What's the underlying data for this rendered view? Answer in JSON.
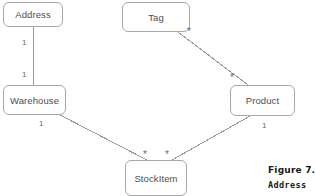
{
  "diagram": {
    "type": "uml-class-diagram",
    "background_color": "#ffffff",
    "node_border_color": "#a8a8a8",
    "node_text_color": "#4d4d4d",
    "edge_color": "#9a9a9a",
    "multiplicity_color": "#6a6a6a",
    "nodes": [
      {
        "id": "address",
        "label": "Address",
        "x": 3,
        "y": 2,
        "w": 60,
        "h": 25
      },
      {
        "id": "tag",
        "label": "Tag",
        "x": 122,
        "y": 2,
        "w": 68,
        "h": 30
      },
      {
        "id": "warehouse",
        "label": "Warehouse",
        "x": 3,
        "y": 85,
        "w": 63,
        "h": 30
      },
      {
        "id": "product",
        "label": "Product",
        "x": 230,
        "y": 85,
        "w": 65,
        "h": 31
      },
      {
        "id": "stockitem",
        "label": "StockItem",
        "x": 125,
        "y": 160,
        "w": 62,
        "h": 36
      }
    ],
    "edges": [
      {
        "id": "address-warehouse",
        "from": "address",
        "to": "warehouse",
        "x1": 33,
        "y1": 27,
        "x2": 33,
        "y2": 85
      },
      {
        "id": "tag-product",
        "from": "tag",
        "to": "product",
        "x1": 178,
        "y1": 32,
        "x2": 248,
        "y2": 85
      },
      {
        "id": "warehouse-stockitem",
        "from": "warehouse",
        "to": "stockitem",
        "x1": 60,
        "y1": 115,
        "x2": 147,
        "y2": 160
      },
      {
        "id": "product-stockitem",
        "from": "product",
        "to": "stockitem",
        "x1": 250,
        "y1": 116,
        "x2": 172,
        "y2": 160
      }
    ],
    "multiplicities": [
      {
        "id": "addr-end",
        "text": "1",
        "x": 22,
        "y": 39,
        "star": false
      },
      {
        "id": "wh-end-top",
        "text": "1",
        "x": 22,
        "y": 71,
        "star": false
      },
      {
        "id": "tag-end",
        "text": "*",
        "x": 187,
        "y": 28,
        "star": true
      },
      {
        "id": "prod-end-top",
        "text": "*",
        "x": 230,
        "y": 74,
        "star": true
      },
      {
        "id": "wh-end-bottom",
        "text": "1",
        "x": 39,
        "y": 120,
        "star": false
      },
      {
        "id": "prod-end-bottom",
        "text": "1",
        "x": 262,
        "y": 122,
        "star": false
      },
      {
        "id": "si-end-left",
        "text": "*",
        "x": 143,
        "y": 151,
        "star": true
      },
      {
        "id": "si-end-right",
        "text": "*",
        "x": 165,
        "y": 151,
        "star": true
      }
    ]
  },
  "caption": {
    "line1": "Figure 7.1",
    "line2": "Address",
    "x": 268,
    "y1": 165,
    "y2": 180
  }
}
